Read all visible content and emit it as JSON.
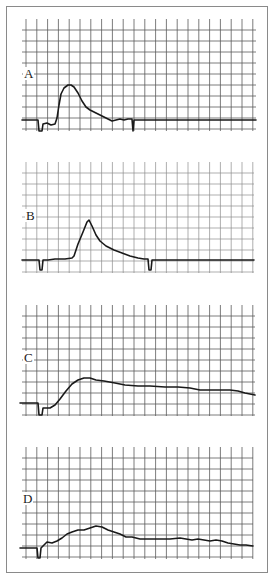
{
  "figure": {
    "border_color": "#8a8a8a",
    "grid_color": "#5a5a5a",
    "trace_color": "#1a1a1a"
  },
  "chart_data": [
    {
      "type": "line",
      "title": "A",
      "label": "A",
      "grid": {
        "x0": 22,
        "x1": 256,
        "y0": 19,
        "y1": 131,
        "dx": 10.8,
        "dy": 11,
        "style": "dark"
      },
      "label_pos": [
        24,
        78
      ],
      "points": [
        [
          22,
          120
        ],
        [
          38,
          120
        ],
        [
          39,
          131
        ],
        [
          42,
          131
        ],
        [
          43,
          124
        ],
        [
          47,
          123
        ],
        [
          51,
          125
        ],
        [
          55,
          124
        ],
        [
          57,
          118
        ],
        [
          59,
          105
        ],
        [
          61,
          94
        ],
        [
          64,
          88
        ],
        [
          68,
          85
        ],
        [
          71,
          85
        ],
        [
          74,
          87
        ],
        [
          78,
          93
        ],
        [
          82,
          101
        ],
        [
          86,
          107
        ],
        [
          90,
          110
        ],
        [
          96,
          113
        ],
        [
          102,
          116
        ],
        [
          108,
          119
        ],
        [
          112,
          121
        ],
        [
          116,
          120
        ],
        [
          120,
          119
        ],
        [
          124,
          120
        ],
        [
          128,
          119
        ],
        [
          132,
          119
        ],
        [
          133,
          131
        ],
        [
          134,
          120
        ],
        [
          256,
          120
        ]
      ],
      "xlabel": "",
      "ylabel": ""
    },
    {
      "type": "line",
      "title": "B",
      "label": "B",
      "grid": {
        "x0": 22,
        "x1": 254,
        "y0": 162,
        "y1": 273,
        "dx": 10.8,
        "dy": 11,
        "style": "light"
      },
      "label_pos": [
        26,
        220
      ],
      "points": [
        [
          22,
          260
        ],
        [
          39,
          260
        ],
        [
          40,
          270
        ],
        [
          42,
          270
        ],
        [
          43,
          260
        ],
        [
          48,
          260
        ],
        [
          55,
          259
        ],
        [
          65,
          259
        ],
        [
          72,
          258
        ],
        [
          74,
          256
        ],
        [
          78,
          244
        ],
        [
          83,
          232
        ],
        [
          87,
          222
        ],
        [
          89,
          220
        ],
        [
          92,
          226
        ],
        [
          96,
          235
        ],
        [
          100,
          241
        ],
        [
          106,
          246
        ],
        [
          114,
          250
        ],
        [
          122,
          253
        ],
        [
          130,
          256
        ],
        [
          138,
          258
        ],
        [
          144,
          259
        ],
        [
          148,
          259
        ],
        [
          149,
          270
        ],
        [
          151,
          270
        ],
        [
          152,
          260
        ],
        [
          254,
          260
        ]
      ],
      "xlabel": "",
      "ylabel": ""
    },
    {
      "type": "line",
      "title": "C",
      "label": "C",
      "grid": {
        "x0": 22,
        "x1": 255,
        "y0": 305,
        "y1": 416,
        "dx": 10.8,
        "dy": 11,
        "style": "dark"
      },
      "label_pos": [
        24,
        362
      ],
      "points": [
        [
          20,
          403
        ],
        [
          38,
          403
        ],
        [
          39,
          415
        ],
        [
          42,
          415
        ],
        [
          43,
          408
        ],
        [
          50,
          408
        ],
        [
          55,
          405
        ],
        [
          60,
          399
        ],
        [
          66,
          391
        ],
        [
          72,
          384
        ],
        [
          78,
          380
        ],
        [
          84,
          378
        ],
        [
          90,
          378
        ],
        [
          96,
          380
        ],
        [
          104,
          381
        ],
        [
          115,
          383
        ],
        [
          125,
          385
        ],
        [
          138,
          386
        ],
        [
          150,
          386
        ],
        [
          165,
          387
        ],
        [
          178,
          387
        ],
        [
          190,
          388
        ],
        [
          200,
          390
        ],
        [
          210,
          390
        ],
        [
          220,
          390
        ],
        [
          230,
          390
        ],
        [
          238,
          391
        ],
        [
          245,
          393
        ],
        [
          255,
          395
        ]
      ],
      "xlabel": "",
      "ylabel": ""
    },
    {
      "type": "line",
      "title": "D",
      "label": "D",
      "grid": {
        "x0": 22,
        "x1": 253,
        "y0": 447,
        "y1": 559,
        "dx": 10.8,
        "dy": 11,
        "style": "dark"
      },
      "label_pos": [
        23,
        503
      ],
      "points": [
        [
          20,
          548
        ],
        [
          37,
          548
        ],
        [
          38,
          558
        ],
        [
          40,
          558
        ],
        [
          41,
          548
        ],
        [
          44,
          545
        ],
        [
          47,
          542
        ],
        [
          52,
          543
        ],
        [
          57,
          541
        ],
        [
          62,
          538
        ],
        [
          67,
          534
        ],
        [
          72,
          532
        ],
        [
          78,
          530
        ],
        [
          84,
          530
        ],
        [
          90,
          528
        ],
        [
          96,
          526
        ],
        [
          102,
          527
        ],
        [
          108,
          530
        ],
        [
          114,
          532
        ],
        [
          120,
          534
        ],
        [
          126,
          537
        ],
        [
          132,
          537
        ],
        [
          140,
          539
        ],
        [
          150,
          539
        ],
        [
          160,
          539
        ],
        [
          170,
          539
        ],
        [
          180,
          538
        ],
        [
          186,
          539
        ],
        [
          192,
          540
        ],
        [
          198,
          539
        ],
        [
          204,
          540
        ],
        [
          210,
          541
        ],
        [
          216,
          540
        ],
        [
          222,
          541
        ],
        [
          228,
          543
        ],
        [
          234,
          544
        ],
        [
          240,
          545
        ],
        [
          246,
          545
        ],
        [
          253,
          546
        ]
      ],
      "xlabel": "",
      "ylabel": ""
    }
  ]
}
